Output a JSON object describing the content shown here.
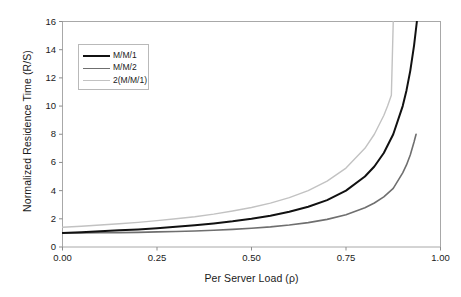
{
  "chart_data": {
    "type": "line",
    "title": "",
    "xlabel": "Per Server Load (ρ)",
    "ylabel": "Normalized Residence Time (R/S)",
    "xlim": [
      0.0,
      1.0
    ],
    "ylim": [
      0,
      16
    ],
    "xticks": [
      "0.00",
      "0.25",
      "0.50",
      "0.75",
      "1.00"
    ],
    "xtick_values": [
      0.0,
      0.25,
      0.5,
      0.75,
      1.0
    ],
    "yticks": [
      "0",
      "2",
      "4",
      "6",
      "8",
      "10",
      "12",
      "14",
      "16"
    ],
    "ytick_values": [
      0,
      2,
      4,
      6,
      8,
      10,
      12,
      14,
      16
    ],
    "grid": false,
    "legend_position": "upper-left",
    "frame": true,
    "series": [
      {
        "name": "M/M/1",
        "color": "#111111",
        "width": 2.0,
        "formula": "1/(1-rho)",
        "x": [
          0.0,
          0.05,
          0.1,
          0.15,
          0.2,
          0.25,
          0.3,
          0.35,
          0.4,
          0.45,
          0.5,
          0.55,
          0.6,
          0.65,
          0.7,
          0.75,
          0.8,
          0.825,
          0.85,
          0.875,
          0.9,
          0.91,
          0.92,
          0.93,
          0.9375
        ],
        "values": [
          1.0,
          1.05,
          1.11,
          1.18,
          1.25,
          1.33,
          1.43,
          1.54,
          1.67,
          1.82,
          2.0,
          2.22,
          2.5,
          2.86,
          3.33,
          4.0,
          5.0,
          5.71,
          6.67,
          8.0,
          10.0,
          11.11,
          12.5,
          14.29,
          16.0
        ]
      },
      {
        "name": "M/M/2",
        "color": "#6f6f6f",
        "width": 1.6,
        "formula": "1 + rho^2/(1-rho^2)",
        "x": [
          0.0,
          0.05,
          0.1,
          0.15,
          0.2,
          0.25,
          0.3,
          0.35,
          0.4,
          0.45,
          0.5,
          0.55,
          0.6,
          0.65,
          0.7,
          0.75,
          0.8,
          0.825,
          0.85,
          0.875,
          0.9,
          0.91,
          0.92,
          0.93,
          0.9354
        ],
        "values": [
          1.0,
          1.0,
          1.01,
          1.02,
          1.04,
          1.07,
          1.1,
          1.14,
          1.19,
          1.25,
          1.33,
          1.43,
          1.56,
          1.73,
          1.96,
          2.29,
          2.78,
          3.12,
          3.56,
          4.16,
          5.26,
          5.82,
          6.53,
          7.45,
          8.0
        ]
      },
      {
        "name": "2(M/M/1)",
        "color": "#c2c2c2",
        "width": 1.4,
        "formula": "2/(1-rho)",
        "x": [
          0.0,
          0.05,
          0.1,
          0.15,
          0.2,
          0.25,
          0.3,
          0.35,
          0.4,
          0.45,
          0.5,
          0.55,
          0.6,
          0.65,
          0.7,
          0.75,
          0.8,
          0.825,
          0.85,
          0.86,
          0.87,
          0.875
        ],
        "values": [
          1.4,
          1.47,
          1.56,
          1.65,
          1.75,
          1.87,
          2.0,
          2.15,
          2.33,
          2.55,
          2.8,
          3.11,
          3.5,
          4.0,
          4.67,
          5.6,
          7.0,
          8.0,
          9.33,
          10.0,
          10.77,
          16.0
        ]
      }
    ]
  },
  "legend": {
    "items": [
      {
        "label": "M/M/1"
      },
      {
        "label": "M/M/2"
      },
      {
        "label": "2(M/M/1)"
      }
    ]
  }
}
